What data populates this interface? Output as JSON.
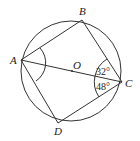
{
  "diagram": {
    "type": "circle-inscribed-quadrilateral",
    "circle": {
      "center_label": "O",
      "cx": 71,
      "cy": 71,
      "r": 50
    },
    "points": {
      "A": {
        "label": "A",
        "x": 21,
        "y": 60
      },
      "B": {
        "label": "B",
        "x": 82,
        "y": 20
      },
      "C": {
        "label": "C",
        "x": 122,
        "y": 82
      },
      "D": {
        "label": "D",
        "x": 58,
        "y": 123
      },
      "O": {
        "label": "O",
        "x": 72,
        "y": 71
      }
    },
    "segments": [
      "AB",
      "BC",
      "CD",
      "DA",
      "AC"
    ],
    "angles": {
      "BCA": "32°",
      "ACD": "48°",
      "BAD": "marked"
    },
    "stroke_color": "#333333"
  }
}
